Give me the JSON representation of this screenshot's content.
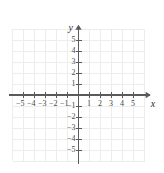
{
  "chart_data": {
    "type": "scatter",
    "title": "",
    "subtitle": "",
    "xlabel": "x",
    "ylabel": "y",
    "xlim": [
      -6.2,
      6.2
    ],
    "ylim": [
      -6.2,
      6.2
    ],
    "grid": true,
    "grid_step": 1,
    "legend": null,
    "series": [],
    "x_tick_labels": [
      "−5",
      "−4",
      "−3",
      "−2",
      "−1",
      "1",
      "2",
      "3",
      "4",
      "5"
    ],
    "x_tick_values": [
      -5,
      -4,
      -3,
      -2,
      -1,
      1,
      2,
      3,
      4,
      5
    ],
    "y_tick_labels": [
      "5",
      "4",
      "3",
      "2",
      "1",
      "−1",
      "−2",
      "−3",
      "−4",
      "−5"
    ],
    "y_tick_values": [
      5,
      4,
      3,
      2,
      1,
      -1,
      -2,
      -3,
      -4,
      -5
    ],
    "origin_label": "",
    "annotations": [],
    "axis_arrows": [
      "x-positive",
      "y-positive"
    ]
  },
  "figure": {
    "x_axis_name": "x",
    "y_axis_name": "y"
  },
  "colors": {
    "background": "#ffffff",
    "grid_line": "#ededed",
    "axis_line": "#5a5a5a",
    "tick_mark": "#5a5a5a",
    "tick_text": "#4a4a4a",
    "axis_name_text": "#2b2b2b"
  }
}
